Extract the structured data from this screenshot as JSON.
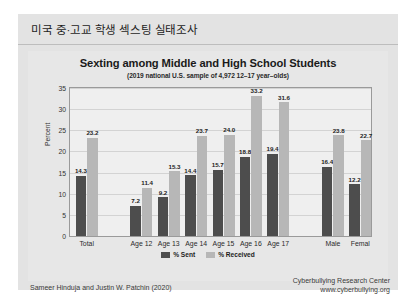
{
  "header": {
    "title": "미국 중·고교 학생 섹스팅 실태조사"
  },
  "chart_data": {
    "type": "bar",
    "title": "Sexting among Middle and High School Students",
    "subtitle": "(2019 national U.S. sample of 4,972 12–17 year–olds)",
    "xlabel": "",
    "ylabel": "Percent",
    "ylim": [
      0,
      35
    ],
    "yticks": [
      0,
      5,
      10,
      15,
      20,
      25,
      30,
      35
    ],
    "grid": true,
    "legend_position": "bottom",
    "categories": [
      "Total",
      "Age 12",
      "Age 13",
      "Age 14",
      "Age 15",
      "Age 16",
      "Age 17",
      "Male",
      "Femal"
    ],
    "series": [
      {
        "name": "% Sent",
        "color": "#4d4d4d",
        "values": [
          14.3,
          7.2,
          9.2,
          14.4,
          15.7,
          18.8,
          19.4,
          16.4,
          12.2
        ]
      },
      {
        "name": "% Received",
        "color": "#b7b7b7",
        "values": [
          23.2,
          11.4,
          15.3,
          23.7,
          24.0,
          33.2,
          31.6,
          23.8,
          22.7
        ]
      }
    ]
  },
  "footer": {
    "credit": "Sameer Hinduja and Justin W. Patchin (2020)",
    "source_org": "Cyberbullying Research Center",
    "source_url": "www.cyberbullying.org"
  }
}
